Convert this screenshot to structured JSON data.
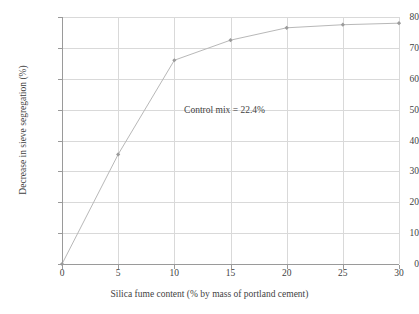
{
  "chart_data": {
    "type": "line",
    "title": "",
    "xlabel": "Silica fume content (% by mass of portland cement)",
    "ylabel": "Decrease in sieve segregation (%)",
    "xlim": [
      0,
      30
    ],
    "ylim": [
      0,
      80
    ],
    "xticks": [
      0,
      5,
      10,
      15,
      20,
      25,
      30
    ],
    "yticks": [
      0,
      10,
      20,
      30,
      40,
      50,
      60,
      70,
      80
    ],
    "xtick_labels": [
      "0",
      "5",
      "10",
      "15",
      "20",
      "25",
      "30"
    ],
    "ytick_labels": [
      "0",
      "10",
      "20",
      "30",
      "40",
      "50",
      "60",
      "70",
      "80"
    ],
    "grid": true,
    "legend": false,
    "annotations": [
      {
        "text": "Control mix = 22.4%",
        "x": 15.5,
        "y": 50
      }
    ],
    "series": [
      {
        "name": "Decrease in sieve segregation",
        "marker": "diamond",
        "color": "#b8b8b8",
        "x": [
          0,
          5,
          10,
          15,
          20,
          25,
          30
        ],
        "values": [
          0,
          35.5,
          66,
          72.5,
          76.5,
          77.5,
          78
        ]
      }
    ]
  },
  "axes": {
    "x_title": "Silica fume content (% by mass of portland cement)",
    "y_title": "Decrease in sieve segregation (%)"
  },
  "colors": {
    "line": "#c2c2c2",
    "marker": "#9b9b9b",
    "grid": "#d9d9d9",
    "axis": "#9a9a9a",
    "text": "#3f3f3f",
    "background": "#ffffff"
  }
}
